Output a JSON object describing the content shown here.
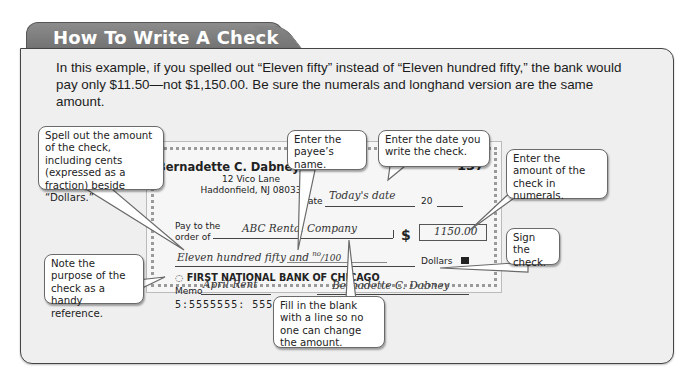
{
  "header": {
    "title": "How To Write A Check"
  },
  "intro": {
    "text": "In this example, if you spelled out “Eleven fifty” instead of “Eleven hundred fifty,” the bank would pay only $11.50—not $1,150.00. Be sure the numerals and longhand version are the same amount."
  },
  "check": {
    "owner_name": "Bernadette C. Dabney",
    "address_line1": "12 Vico Lane",
    "address_line2": "Haddonfield, NJ 08033",
    "check_number": "137",
    "date_label": "Date",
    "date_value": "Today's date",
    "year_prefix": "20",
    "pay_to_label_line1": "Pay to the",
    "pay_to_label_line2": "order of",
    "payee": "ABC Rental Company",
    "dollar_sign": "$",
    "amount_numeric": "1150.00",
    "amount_words": "Eleven hundred fifty and",
    "cents_numerator": "no",
    "cents_denominator": "/100",
    "dollars_label": "Dollars",
    "bank_name": "FIRST NATIONAL BANK OF CHICAGO",
    "memo_label": "Memo",
    "memo_value": "April Rent",
    "signature": "Bernadette C. Dabney",
    "micr_line": "5:5555555: 555 555555:0137"
  },
  "callouts": {
    "spell_amount": "Spell out the amount of the check, including cents (expressed as a fraction) beside “Dollars.”",
    "payee_name": "Enter the payee’s name.",
    "date": "Enter the date you write the check.",
    "amount_numerals": "Enter the amount of the check in numerals.",
    "memo": "Note the purpose of the check as a handy reference.",
    "sign": "Sign the check.",
    "fill_blank": "Fill in the blank with a line so no one can change the amount."
  },
  "colors": {
    "tab_bg": "#7a7a7a",
    "panel_bg": "#efefef",
    "callout_border": "#6a6a6a"
  }
}
